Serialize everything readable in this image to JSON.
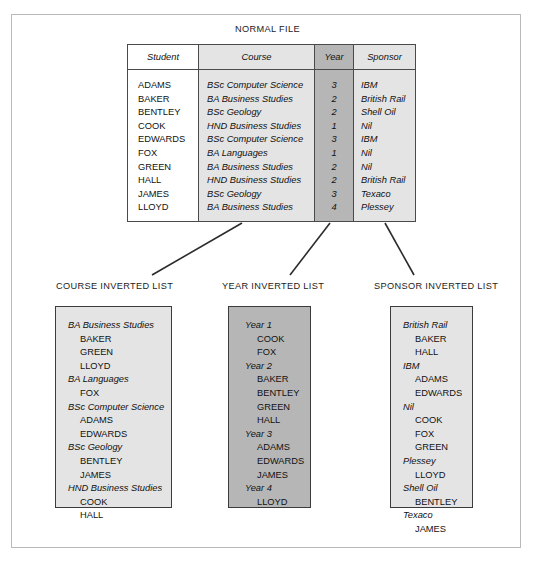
{
  "figure": {
    "normal_file_title": "NORMAL FILE",
    "course_list_title": "COURSE INVERTED LIST",
    "year_list_title": "YEAR INVERTED LIST",
    "sponsor_list_title": "SPONSOR INVERTED LIST"
  },
  "colors": {
    "white_column": "#ffffff",
    "light_gray_column": "#e4e4e4",
    "dark_gray_column": "#b6b6b6",
    "border": "#4a4a4a",
    "outer_frame": "#b9b9b9",
    "text": "#111111"
  },
  "normal_file": {
    "headers": [
      "Student",
      "Course",
      "Year",
      "Sponsor"
    ],
    "rows": [
      {
        "student": "ADAMS",
        "course": "BSc Computer Science",
        "year": "3",
        "sponsor": "IBM"
      },
      {
        "student": "BAKER",
        "course": "BA Business Studies",
        "year": "2",
        "sponsor": "British Rail"
      },
      {
        "student": "BENTLEY",
        "course": "BSc Geology",
        "year": "2",
        "sponsor": "Shell Oil"
      },
      {
        "student": "COOK",
        "course": "HND Business Studies",
        "year": "1",
        "sponsor": "Nil"
      },
      {
        "student": "EDWARDS",
        "course": "BSc Computer Science",
        "year": "3",
        "sponsor": "IBM"
      },
      {
        "student": "FOX",
        "course": "BA Languages",
        "year": "1",
        "sponsor": "Nil"
      },
      {
        "student": "GREEN",
        "course": "BA Business Studies",
        "year": "2",
        "sponsor": "Nil"
      },
      {
        "student": "HALL",
        "course": "HND Business Studies",
        "year": "2",
        "sponsor": "British Rail"
      },
      {
        "student": "JAMES",
        "course": "BSc Geology",
        "year": "3",
        "sponsor": "Texaco"
      },
      {
        "student": "LLOYD",
        "course": "BA Business Studies",
        "year": "4",
        "sponsor": "Plessey"
      }
    ]
  },
  "course_inverted_list": {
    "entries": [
      {
        "key": "BA Business Studies",
        "values": [
          "BAKER",
          "GREEN",
          "LLOYD"
        ]
      },
      {
        "key": "BA Languages",
        "values": [
          "FOX"
        ]
      },
      {
        "key": "BSc Computer Science",
        "values": [
          "ADAMS",
          "EDWARDS"
        ]
      },
      {
        "key": "BSc Geology",
        "values": [
          "BENTLEY",
          "JAMES"
        ]
      },
      {
        "key": "HND Business Studies",
        "values": [
          "COOK",
          "HALL"
        ]
      }
    ]
  },
  "year_inverted_list": {
    "entries": [
      {
        "key": "Year 1",
        "values": [
          "COOK",
          "FOX"
        ]
      },
      {
        "key": "Year 2",
        "values": [
          "BAKER",
          "BENTLEY",
          "GREEN",
          "HALL"
        ]
      },
      {
        "key": "Year 3",
        "values": [
          "ADAMS",
          "EDWARDS",
          "JAMES"
        ]
      },
      {
        "key": "Year 4",
        "values": [
          "LLOYD"
        ]
      }
    ]
  },
  "sponsor_inverted_list": {
    "entries": [
      {
        "key": "British Rail",
        "values": [
          "BAKER",
          "HALL"
        ]
      },
      {
        "key": "IBM",
        "values": [
          "ADAMS",
          "EDWARDS"
        ]
      },
      {
        "key": "Nil",
        "values": [
          "COOK",
          "FOX",
          "GREEN"
        ]
      },
      {
        "key": "Plessey",
        "values": [
          "LLOYD"
        ]
      },
      {
        "key": "Shell Oil",
        "values": [
          "BENTLEY"
        ]
      },
      {
        "key": "Texaco",
        "values": [
          "JAMES"
        ]
      }
    ]
  }
}
